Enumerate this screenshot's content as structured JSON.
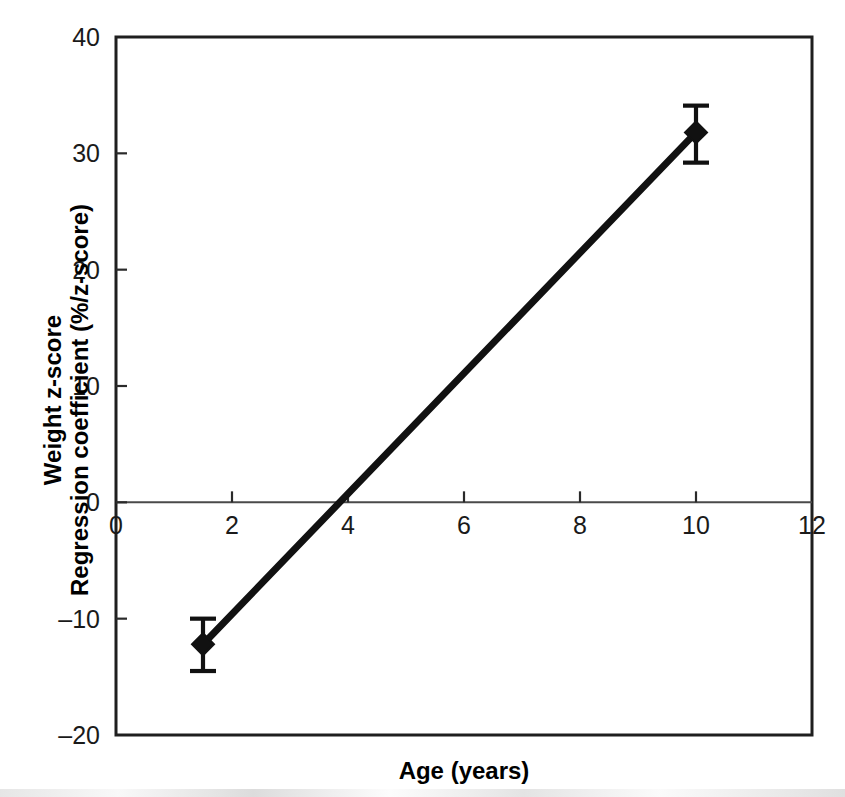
{
  "chart_data": {
    "type": "line",
    "title": "",
    "subtitle": "",
    "xlabel": "Age (years)",
    "ylabel": "Weight z-score\nRegression coefficient (%/z-score)",
    "ylabel_lines": [
      "Weight z-score",
      "Regression coefficient (%/z-score)"
    ],
    "xlim": [
      0,
      12
    ],
    "ylim": [
      -20,
      40
    ],
    "xticks": [
      0,
      2,
      4,
      6,
      8,
      10,
      12
    ],
    "xtick_labels": [
      "0",
      "2",
      "4",
      "6",
      "8",
      "10",
      "12"
    ],
    "yticks": [
      -20,
      -10,
      0,
      10,
      20,
      30,
      40
    ],
    "ytick_labels": [
      "–20",
      "–10",
      "0",
      "10",
      "20",
      "30",
      "40"
    ],
    "grid": false,
    "legend": false,
    "legend_position": "none",
    "zero_reference_line": 0,
    "marker": "diamond",
    "line_color": "#111111",
    "series": [
      {
        "name": "Weight z-score regression coefficient",
        "x": [
          1.5,
          10.0
        ],
        "values": [
          -12.2,
          31.8
        ],
        "error_low": [
          -14.5,
          29.2
        ],
        "error_high": [
          -10.0,
          34.1
        ],
        "error_bars": [
          2.3,
          2.4
        ]
      }
    ],
    "points": [
      {
        "x": 1.5,
        "y": -12.2,
        "err_low": -14.5,
        "err_high": -10.0
      },
      {
        "x": 10.0,
        "y": 31.8,
        "err_low": 29.2,
        "err_high": 34.1
      }
    ],
    "annotations": [],
    "x_intercept": 3.85
  }
}
